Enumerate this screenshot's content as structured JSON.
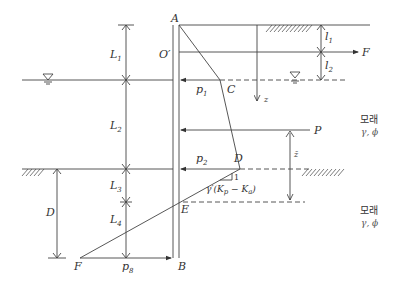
{
  "diagram": {
    "points": {
      "A": "A",
      "O_prime": "O′",
      "C": "C",
      "D": "D",
      "E": "E",
      "F": "F",
      "B": "B"
    },
    "dimensions_left": {
      "L1": "L",
      "L1_sub": "1",
      "L2": "L",
      "L2_sub": "2",
      "L3": "L",
      "L3_sub": "3",
      "L4": "L",
      "L4_sub": "4",
      "D": "D"
    },
    "dimensions_right": {
      "l1": "l",
      "l1_sub": "1",
      "l2": "l",
      "l2_sub": "2"
    },
    "forces": {
      "anchor": "F",
      "resultant": "P",
      "p1": "p",
      "p1_sub": "1",
      "p2": "p",
      "p2_sub": "2",
      "p8": "p",
      "p8_sub": "8",
      "z": "z",
      "zbar": "z̄"
    },
    "slope": {
      "one": "1",
      "expression": "γ′(K",
      "kp_sub": "p",
      "minus": " − K",
      "ka_sub": "a",
      "close": ")"
    },
    "soil_layers": [
      {
        "material": "모래",
        "params": "γ, ϕ"
      },
      {
        "material": "모래",
        "params": "γ, ϕ"
      }
    ]
  }
}
